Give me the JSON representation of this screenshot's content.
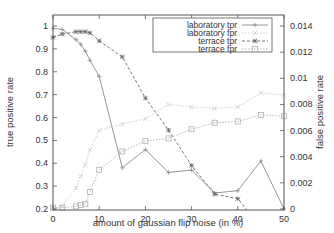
{
  "chart_data": {
    "type": "line",
    "title": "",
    "xlabel": "amount of gaussian flip noise (in %)",
    "ylabel": "true positive rate",
    "y2label": "false positive rate",
    "xlim": [
      0,
      50
    ],
    "ylim": [
      0.2,
      1.05
    ],
    "y2lim": [
      0,
      0.0149
    ],
    "grid": false,
    "legend_position": "upper right",
    "xticks": [
      0,
      10,
      20,
      30,
      40,
      50
    ],
    "yticks": [
      0.2,
      0.3,
      0.4,
      0.5,
      0.6,
      0.7,
      0.8,
      0.9,
      1
    ],
    "y2ticks": [
      0,
      0.002,
      0.004,
      0.006,
      0.008,
      0.01,
      0.012,
      0.014
    ],
    "x": [
      0,
      2,
      5,
      6,
      7,
      8,
      10,
      15,
      20,
      25,
      30,
      35,
      40,
      45,
      50
    ],
    "series": [
      {
        "name": "laboratory tpr",
        "axis": "left",
        "marker": "plus",
        "dash": "solid",
        "values": [
          0.99,
          0.985,
          0.94,
          0.92,
          0.89,
          0.85,
          0.78,
          0.38,
          0.46,
          0.36,
          0.37,
          0.27,
          0.28,
          0.41,
          0.2
        ]
      },
      {
        "name": "laboratory fpr",
        "axis": "right",
        "marker": "cross",
        "dash": "dotted",
        "values": [
          0.0001,
          0.0002,
          0.0016,
          0.0025,
          0.0034,
          0.0045,
          0.006,
          0.0065,
          0.0069,
          0.008,
          0.0078,
          0.0077,
          0.0078,
          0.0089,
          0.0087
        ]
      },
      {
        "name": "terrace tpr",
        "axis": "left",
        "marker": "star",
        "dash": "dashed",
        "values": [
          0.95,
          0.965,
          0.975,
          0.975,
          0.975,
          0.97,
          0.935,
          0.865,
          0.685,
          0.545,
          0.39,
          0.265,
          0.245,
          0.13,
          0.1
        ]
      },
      {
        "name": "terrace fpr",
        "axis": "right",
        "marker": "square",
        "dash": "dotted",
        "values": [
          0.0001,
          0.0001,
          0.0002,
          0.0003,
          0.0004,
          0.0013,
          0.003,
          0.0044,
          0.0052,
          0.0054,
          0.0061,
          0.0066,
          0.0067,
          0.0072,
          0.0071
        ]
      }
    ]
  },
  "styles": {
    "axis_color": "#555555",
    "series_colors": [
      "#8a8a8a",
      "#c8c8c8",
      "#666666",
      "#b0b0b0"
    ]
  }
}
